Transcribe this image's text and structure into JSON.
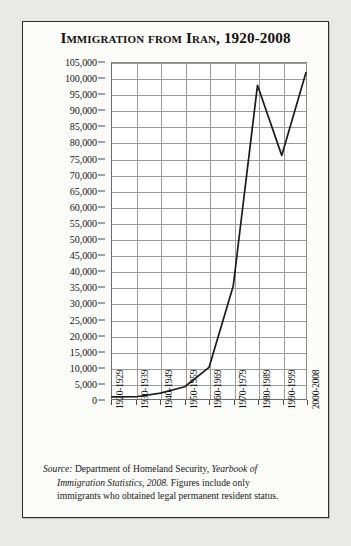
{
  "card": {
    "title": "Immigration from Iran, 1920-2008"
  },
  "chart_data": {
    "type": "line",
    "title": "Immigration from Iran, 1920-2008",
    "xlabel": "",
    "ylabel": "Total immigrants per decade",
    "categories": [
      "1920-1929",
      "1930-1939",
      "1940-1949",
      "1950-1959",
      "1960-1969",
      "1970-1979",
      "1980-1989",
      "1990-1999",
      "2000-2008"
    ],
    "values": [
      208,
      252,
      1380,
      3388,
      9459,
      35000,
      98000,
      76000,
      102000
    ],
    "ylim": [
      0,
      105000
    ],
    "ytick_step": 5000,
    "ytick_labels": [
      "0",
      "5,000",
      "10,000",
      "15,000",
      "20,000",
      "25,000",
      "30,000",
      "35,000",
      "40,000",
      "45,000",
      "50,000",
      "55,000",
      "60,000",
      "65,000",
      "70,000",
      "75,000",
      "80,000",
      "85,000",
      "90,000",
      "95,000",
      "100,000",
      "105,000"
    ],
    "grid": true,
    "legend": "none",
    "line_color": "#1c1c1c"
  },
  "source": {
    "line1_label": "Source:",
    "line1_rest": " Department of Homeland Security, ",
    "line1_italic": "Yearbook of",
    "line2_italic": "Immigration Statistics, 2008.",
    "line2_rest": " Figures include only",
    "line3": "immigrants who obtained legal permanent resident status."
  }
}
